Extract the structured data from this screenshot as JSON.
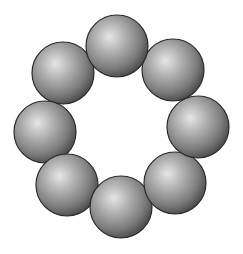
{
  "diagram": {
    "type": "ring-of-spheres",
    "sphere_count": 8,
    "colors": {
      "highlight": "#e6e6e6",
      "mid": "#9a9a9a",
      "shadow": "#4a4a4a",
      "outline": "#2a2a2a",
      "background": "#ffffff"
    },
    "spheres": [
      {
        "id": "top",
        "cx": 117,
        "cy": 46,
        "r": 31
      },
      {
        "id": "top-right",
        "cx": 173,
        "cy": 70,
        "r": 31
      },
      {
        "id": "right",
        "cx": 198,
        "cy": 127,
        "r": 31
      },
      {
        "id": "bottom-right",
        "cx": 175,
        "cy": 183,
        "r": 31
      },
      {
        "id": "bottom",
        "cx": 121,
        "cy": 207,
        "r": 31
      },
      {
        "id": "bottom-left",
        "cx": 67,
        "cy": 185,
        "r": 31
      },
      {
        "id": "left",
        "cx": 45,
        "cy": 132,
        "r": 31
      },
      {
        "id": "top-left",
        "cx": 63,
        "cy": 73,
        "r": 31
      }
    ],
    "draw_order": [
      "top-left",
      "left",
      "bottom-left",
      "bottom",
      "bottom-right",
      "right",
      "top-right",
      "top"
    ]
  }
}
